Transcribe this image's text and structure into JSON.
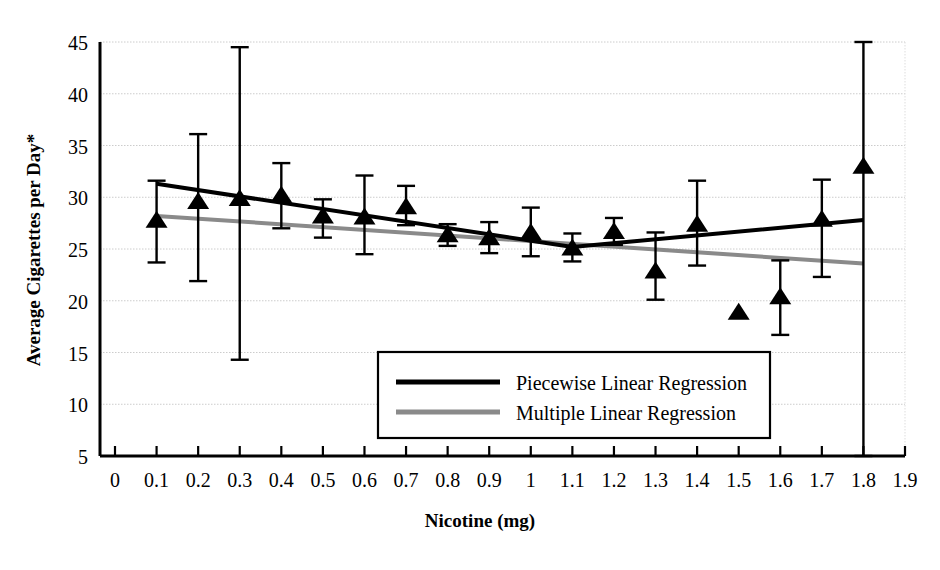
{
  "chart_data": {
    "type": "scatter",
    "title": "",
    "xlabel": "Nicotine (mg)",
    "ylabel": "Average Cigarettes per Day*",
    "xlim": [
      0,
      1.9
    ],
    "ylim": [
      5,
      45
    ],
    "xticks": [
      "0",
      "0.1",
      "0.2",
      "0.3",
      "0.4",
      "0.5",
      "0.6",
      "0.7",
      "0.8",
      "0.9",
      "1",
      "1.1",
      "1.2",
      "1.3",
      "1.4",
      "1.5",
      "1.6",
      "1.7",
      "1.8",
      "1.9"
    ],
    "xtick_values": [
      0,
      0.1,
      0.2,
      0.3,
      0.4,
      0.5,
      0.6,
      0.7,
      0.8,
      0.9,
      1.0,
      1.1,
      1.2,
      1.3,
      1.4,
      1.5,
      1.6,
      1.7,
      1.8,
      1.9
    ],
    "yticks": [
      "5",
      "10",
      "15",
      "20",
      "25",
      "30",
      "35",
      "40",
      "45"
    ],
    "ytick_values": [
      5,
      10,
      15,
      20,
      25,
      30,
      35,
      40,
      45
    ],
    "grid": true,
    "grid_axis": "y",
    "legend_position": "inside-lower-center",
    "marker": "triangle-up",
    "marker_color": "#000000",
    "points": [
      {
        "x": 0.1,
        "y": 27.8,
        "err_low": 23.7,
        "err_high": 31.6
      },
      {
        "x": 0.2,
        "y": 29.6,
        "err_low": 21.9,
        "err_high": 36.1
      },
      {
        "x": 0.3,
        "y": 29.9,
        "err_low": 14.3,
        "err_high": 44.5
      },
      {
        "x": 0.4,
        "y": 30.2,
        "err_low": 27.0,
        "err_high": 33.3
      },
      {
        "x": 0.5,
        "y": 28.2,
        "err_low": 26.1,
        "err_high": 29.8
      },
      {
        "x": 0.6,
        "y": 28.1,
        "err_low": 24.5,
        "err_high": 32.1
      },
      {
        "x": 0.7,
        "y": 29.1,
        "err_low": 27.3,
        "err_high": 31.1
      },
      {
        "x": 0.8,
        "y": 26.4,
        "err_low": 25.3,
        "err_high": 27.4
      },
      {
        "x": 0.9,
        "y": 26.1,
        "err_low": 24.6,
        "err_high": 27.6
      },
      {
        "x": 1.0,
        "y": 26.6,
        "err_low": 24.3,
        "err_high": 29.0
      },
      {
        "x": 1.1,
        "y": 25.1,
        "err_low": 23.8,
        "err_high": 26.5
      },
      {
        "x": 1.2,
        "y": 26.7,
        "err_low": 25.4,
        "err_high": 28.0
      },
      {
        "x": 1.3,
        "y": 22.9,
        "err_low": 20.1,
        "err_high": 26.6
      },
      {
        "x": 1.4,
        "y": 27.4,
        "err_low": 23.4,
        "err_high": 31.6
      },
      {
        "x": 1.5,
        "y": 18.9,
        "err_low": 18.9,
        "err_high": 18.9
      },
      {
        "x": 1.6,
        "y": 20.4,
        "err_low": 16.7,
        "err_high": 23.9
      },
      {
        "x": 1.7,
        "y": 27.9,
        "err_low": 22.3,
        "err_high": 31.7
      },
      {
        "x": 1.8,
        "y": 33.0,
        "err_low": 5.0,
        "err_high": 45.0
      }
    ],
    "series": [
      {
        "name": "Piecewise Linear Regression",
        "type": "line",
        "color": "#000000",
        "width": 4,
        "vertices": [
          {
            "x": 0.1,
            "y": 31.3
          },
          {
            "x": 1.1,
            "y": 25.2
          },
          {
            "x": 1.8,
            "y": 27.8
          }
        ]
      },
      {
        "name": "Multiple Linear Regression",
        "type": "line",
        "color": "#8a8a8a",
        "width": 4,
        "vertices": [
          {
            "x": 0.1,
            "y": 28.2
          },
          {
            "x": 1.8,
            "y": 23.6
          }
        ]
      }
    ]
  },
  "legend": {
    "items": [
      {
        "label": "Piecewise Linear Regression",
        "swatch": "black-line-swatch"
      },
      {
        "label": "Multiple Linear Regression",
        "swatch": "gray-line-swatch"
      }
    ]
  },
  "colors": {
    "piecewise": "#000000",
    "multiple": "#8a8a8a",
    "grid": "#cccccc",
    "axis": "#000000",
    "background": "#ffffff"
  }
}
